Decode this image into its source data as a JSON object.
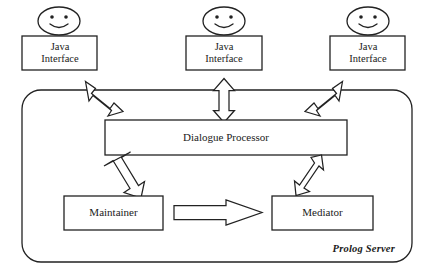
{
  "diagram": {
    "container": {
      "label": "Prolog Server",
      "name": "prolog-server-container"
    },
    "interfaces": [
      {
        "label": "Java\nInterface",
        "face": "smiley-face-icon"
      },
      {
        "label": "Java\nInterface",
        "face": "smiley-face-icon"
      },
      {
        "label": "Java\nInterface",
        "face": "smiley-face-icon"
      }
    ],
    "nodes": {
      "dialogue_processor": "Dialogue Processor",
      "maintainer": "Maintainer",
      "mediator": "Mediator"
    },
    "connectors": [
      {
        "name": "iface1-to-dialogue",
        "kind": "double-headed-arrow",
        "direction": "diagonal-down-right"
      },
      {
        "name": "iface2-to-dialogue",
        "kind": "double-headed-arrow",
        "direction": "vertical"
      },
      {
        "name": "iface3-to-dialogue",
        "kind": "double-headed-arrow",
        "direction": "diagonal-down-left"
      },
      {
        "name": "dialogue-to-maintainer",
        "kind": "single-headed-arrow",
        "direction": "diagonal-down-left"
      },
      {
        "name": "dialogue-to-mediator",
        "kind": "double-headed-arrow",
        "direction": "diagonal-down-left"
      },
      {
        "name": "maintainer-to-mediator",
        "kind": "single-headed-arrow",
        "direction": "right"
      }
    ],
    "colors": {
      "stroke": "#222222",
      "text": "#1a1a1a",
      "background": "#ffffff"
    }
  }
}
